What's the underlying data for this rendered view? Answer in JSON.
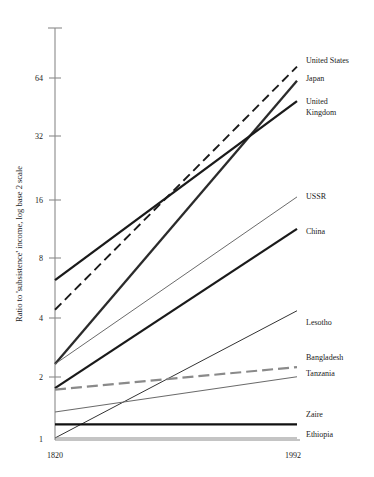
{
  "chart_data": {
    "type": "line",
    "title": "",
    "subtitle": "",
    "xlabel": "",
    "ylabel": "Ratio to 'subsistence' income, log base 2 scale",
    "x": [
      1820,
      1992
    ],
    "xtick_labels": [
      "1820",
      "1992"
    ],
    "ytick_labels": [
      "1",
      "2",
      "4",
      "8",
      "16",
      "32",
      "64"
    ],
    "ytick_values": [
      1,
      2,
      4,
      8,
      16,
      32,
      64
    ],
    "ylim": [
      1,
      90
    ],
    "yscale": "log2",
    "grid": false,
    "legend_position": "right-inline-labels",
    "series": [
      {
        "name": "United States",
        "values": [
          4.4,
          73
        ],
        "style": "dashed",
        "color": "#1a1a1a",
        "width": 1.9,
        "label_y": 60
      },
      {
        "name": "Japan",
        "values": [
          2.35,
          62
        ],
        "style": "solid",
        "color": "#2b2b2b",
        "width": 2.3,
        "label_y": 78
      },
      {
        "name": "United Kingdom",
        "values": [
          6.2,
          49
        ],
        "style": "solid",
        "color": "#1a1a1a",
        "width": 2.3,
        "label_y": 101
      },
      {
        "name": "USSR",
        "values": [
          2.35,
          16.2
        ],
        "style": "solid",
        "color": "#6b6b6b",
        "width": 1.0,
        "label_y": 196
      },
      {
        "name": "China",
        "values": [
          1.78,
          11.2
        ],
        "style": "solid",
        "color": "#1a1a1a",
        "width": 2.3,
        "label_y": 231
      },
      {
        "name": "Lesotho",
        "values": [
          1.0,
          4.35
        ],
        "style": "solid",
        "color": "#333333",
        "width": 1.0,
        "label_y": 322
      },
      {
        "name": "Bangladesh",
        "values": [
          1.75,
          2.27
        ],
        "style": "dash-dot",
        "color": "#8a8a8a",
        "width": 2.2,
        "label_y": 357
      },
      {
        "name": "Tanzania",
        "values": [
          1.35,
          2.03
        ],
        "style": "solid",
        "color": "#6b6b6b",
        "width": 1.1,
        "label_y": 373
      },
      {
        "name": "Zaire",
        "values": [
          1.17,
          1.17
        ],
        "style": "solid",
        "color": "#111111",
        "width": 2.4,
        "label_y": 414
      },
      {
        "name": "Ethiopia",
        "values": [
          1.0,
          1.0
        ],
        "style": "solid",
        "color": "#8a8a8a",
        "width": 1.2,
        "label_y": 434
      }
    ]
  },
  "axis": {
    "y_title": "Ratio to 'subsistence' income, log base 2 scale",
    "tick_64": "64",
    "tick_32": "32",
    "tick_16": "16",
    "tick_8": "8",
    "tick_4": "4",
    "tick_2": "2",
    "tick_1": "1",
    "x_start": "1820",
    "x_end": "1992"
  },
  "labels": {
    "united_states": "United States",
    "japan": "Japan",
    "united_kingdom_line1": "United",
    "united_kingdom_line2": "Kingdom",
    "ussr": "USSR",
    "china": "China",
    "lesotho": "Lesotho",
    "bangladesh": "Bangladesh",
    "tanzania": "Tanzania",
    "zaire": "Zaire",
    "ethiopia": "Ethiopia"
  }
}
